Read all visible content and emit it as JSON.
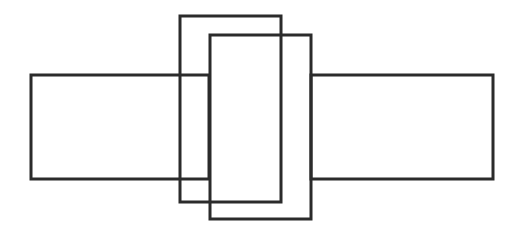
{
  "diagram": {
    "background": "#ffffff",
    "stroke_color": "#2b2b2b",
    "stroke_width": 3,
    "shapes": [
      {
        "id": "left-rect",
        "type": "rect",
        "x": 31,
        "y": 75,
        "width": 178,
        "height": 104
      },
      {
        "id": "right-rect",
        "type": "rect",
        "x": 311,
        "y": 75,
        "width": 182,
        "height": 104
      },
      {
        "id": "tall-rect-back",
        "type": "rect",
        "x": 180,
        "y": 16,
        "width": 101,
        "height": 186
      },
      {
        "id": "tall-rect-front",
        "type": "rect",
        "x": 210,
        "y": 35,
        "width": 101,
        "height": 184
      }
    ]
  }
}
